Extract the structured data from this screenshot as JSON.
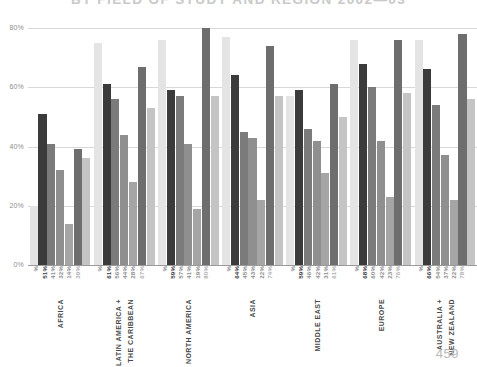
{
  "title": "BY FIELD OF STUDY AND REGION 2002—03",
  "page_number": "459",
  "axis": {
    "y_ticks": [
      "0%",
      "20%",
      "40%",
      "60%",
      "80%"
    ],
    "y_min": 0,
    "y_max": 80
  },
  "colors": {
    "series_1": "#e4e4e4",
    "series_2": "#3b3b3b",
    "series_3": "#7b7b7b",
    "series_4": "#8f8f8f",
    "series_5": "#a5a5a5",
    "series_6": "#6e6e6e",
    "series_7": "#c4c4c4",
    "grid": "#d8d8d8",
    "baseline": "#9a9a9a",
    "title": "#c9c9c9",
    "page_number": "#b9b9b9"
  },
  "chart_data": {
    "type": "bar",
    "title": "BY FIELD OF STUDY AND REGION 2002—03",
    "xlabel": "",
    "ylabel": "",
    "ylim": [
      0,
      80
    ],
    "grid": true,
    "legend": "none",
    "categories": [
      "AFRICA",
      "LATIN AMERICA + THE CARIBBEAN",
      "NORTH AMERICA",
      "ASIA",
      "MIDDLE EAST",
      "EUROPE",
      "AUSTRALIA + NEW ZEALAND"
    ],
    "series": [
      {
        "name": "series-1",
        "values": [
          20,
          75,
          76,
          77,
          57,
          76,
          76
        ]
      },
      {
        "name": "series-2",
        "values": [
          51,
          61,
          59,
          64,
          59,
          68,
          66
        ]
      },
      {
        "name": "series-3",
        "values": [
          41,
          56,
          57,
          45,
          46,
          60,
          54
        ]
      },
      {
        "name": "series-4",
        "values": [
          32,
          44,
          41,
          43,
          42,
          42,
          37
        ]
      },
      {
        "name": "series-5",
        "values": [
          14,
          28,
          19,
          22,
          31,
          23,
          22
        ]
      },
      {
        "name": "series-6",
        "values": [
          39,
          67,
          80,
          74,
          61,
          76,
          78
        ]
      },
      {
        "name": "series-7",
        "values": [
          36,
          53,
          57,
          57,
          50,
          58,
          56
        ]
      }
    ],
    "groups": [
      {
        "region": "AFRICA",
        "region_lines": [
          "AFRICA"
        ],
        "bars": [
          {
            "label": "%",
            "value": 20
          },
          {
            "label": "51%",
            "value": 51
          },
          {
            "label": "41%",
            "value": 41
          },
          {
            "label": "32%",
            "value": 32
          },
          {
            "label": "14%",
            "value": 14
          },
          {
            "label": "39%",
            "value": 39
          },
          {
            "label": "",
            "value": 36
          }
        ]
      },
      {
        "region": "LATIN AMERICA + THE CARIBBEAN",
        "region_lines": [
          "LATIN AMERICA +",
          "THE CARIBBEAN"
        ],
        "bars": [
          {
            "label": "%",
            "value": 75
          },
          {
            "label": "61%",
            "value": 61
          },
          {
            "label": "56%",
            "value": 56
          },
          {
            "label": "44%",
            "value": 44
          },
          {
            "label": "28%",
            "value": 28
          },
          {
            "label": "67%",
            "value": 67
          },
          {
            "label": "",
            "value": 53
          }
        ]
      },
      {
        "region": "NORTH AMERICA",
        "region_lines": [
          "NORTH AMERICA"
        ],
        "bars": [
          {
            "label": "%",
            "value": 76
          },
          {
            "label": "59%",
            "value": 59
          },
          {
            "label": "57%",
            "value": 57
          },
          {
            "label": "41%",
            "value": 41
          },
          {
            "label": "19%",
            "value": 19
          },
          {
            "label": "80%",
            "value": 80
          },
          {
            "label": "",
            "value": 57
          }
        ]
      },
      {
        "region": "ASIA",
        "region_lines": [
          "ASIA"
        ],
        "bars": [
          {
            "label": "%",
            "value": 77
          },
          {
            "label": "64%",
            "value": 64
          },
          {
            "label": "45%",
            "value": 45
          },
          {
            "label": "43%",
            "value": 43
          },
          {
            "label": "22%",
            "value": 22
          },
          {
            "label": "74%",
            "value": 74
          },
          {
            "label": "",
            "value": 57
          }
        ]
      },
      {
        "region": "MIDDLE EAST",
        "region_lines": [
          "MIDDLE EAST"
        ],
        "bars": [
          {
            "label": "%",
            "value": 57
          },
          {
            "label": "59%",
            "value": 59
          },
          {
            "label": "46%",
            "value": 46
          },
          {
            "label": "42%",
            "value": 42
          },
          {
            "label": "31%",
            "value": 31
          },
          {
            "label": "61%",
            "value": 61
          },
          {
            "label": "",
            "value": 50
          }
        ]
      },
      {
        "region": "EUROPE",
        "region_lines": [
          "EUROPE"
        ],
        "bars": [
          {
            "label": "%",
            "value": 76
          },
          {
            "label": "68%",
            "value": 68
          },
          {
            "label": "60%",
            "value": 60
          },
          {
            "label": "42%",
            "value": 42
          },
          {
            "label": "23%",
            "value": 23
          },
          {
            "label": "76%",
            "value": 76
          },
          {
            "label": "",
            "value": 58
          }
        ]
      },
      {
        "region": "AUSTRALIA + NEW ZEALAND",
        "region_lines": [
          "AUSTRALIA +",
          "NEW ZEALAND"
        ],
        "bars": [
          {
            "label": "%",
            "value": 76
          },
          {
            "label": "66%",
            "value": 66
          },
          {
            "label": "54%",
            "value": 54
          },
          {
            "label": "37%",
            "value": 37
          },
          {
            "label": "22%",
            "value": 22
          },
          {
            "label": "78%",
            "value": 78
          },
          {
            "label": "",
            "value": 56
          }
        ]
      }
    ]
  }
}
